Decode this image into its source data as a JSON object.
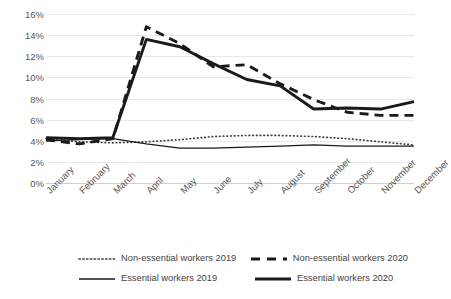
{
  "chart_data": {
    "type": "line",
    "title": "",
    "xlabel": "",
    "ylabel": "",
    "ylim": [
      0,
      16
    ],
    "ytick_labels": [
      "0%",
      "2%",
      "4%",
      "6%",
      "8%",
      "10%",
      "12%",
      "14%",
      "16%"
    ],
    "ytick_values": [
      0,
      2,
      4,
      6,
      8,
      10,
      12,
      14,
      16
    ],
    "grid": true,
    "legend_position": "bottom",
    "categories": [
      "January",
      "February",
      "March",
      "April",
      "May",
      "June",
      "July",
      "August",
      "September",
      "October",
      "November",
      "December"
    ],
    "series": [
      {
        "name": "Non-essential workers 2019",
        "style": "dotted",
        "color": "#404040",
        "values": [
          4.2,
          3.9,
          3.8,
          3.9,
          4.1,
          4.4,
          4.5,
          4.5,
          4.4,
          4.2,
          3.9,
          3.6
        ]
      },
      {
        "name": "Non-essential workers 2020",
        "style": "dashed",
        "color": "#1a1a1a",
        "values": [
          4.1,
          3.7,
          4.2,
          14.8,
          13.2,
          11.0,
          11.2,
          9.4,
          7.9,
          6.7,
          6.4,
          6.4
        ]
      },
      {
        "name": "Essential workers 2019",
        "style": "solid-thin",
        "color": "#1a1a1a",
        "values": [
          4.0,
          4.1,
          4.2,
          3.7,
          3.3,
          3.3,
          3.4,
          3.5,
          3.6,
          3.5,
          3.5,
          3.5
        ]
      },
      {
        "name": "Essential workers 2020",
        "style": "solid-thick",
        "color": "#1a1a1a",
        "values": [
          4.3,
          4.2,
          4.3,
          13.6,
          12.9,
          11.3,
          9.8,
          9.2,
          7.0,
          7.1,
          7.0,
          7.7
        ]
      }
    ]
  },
  "legend": {
    "items": [
      {
        "label": "Non-essential workers 2019",
        "style": "dotted"
      },
      {
        "label": "Non-essential workers 2020",
        "style": "dashed"
      },
      {
        "label": "Essential workers 2019",
        "style": "solid-thin"
      },
      {
        "label": "Essential workers 2020",
        "style": "solid-thick"
      }
    ]
  }
}
